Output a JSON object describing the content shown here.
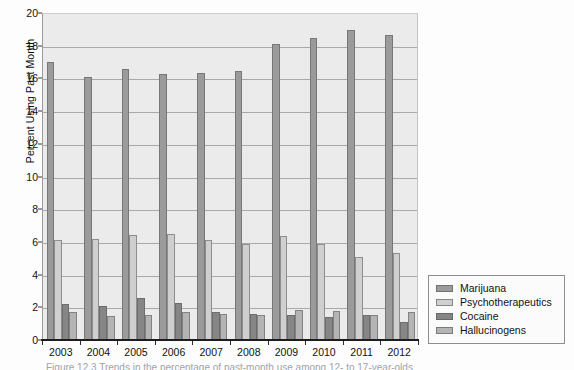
{
  "chart_data": {
    "type": "bar",
    "title": "",
    "subtitle": "",
    "xlabel": "",
    "ylabel": "Percent Using Past Month",
    "categories": [
      "2003",
      "2004",
      "2005",
      "2006",
      "2007",
      "2008",
      "2009",
      "2010",
      "2011",
      "2012"
    ],
    "ylim": [
      0,
      20
    ],
    "ytick_step": 2,
    "yticks": [
      "0",
      "2",
      "4",
      "6",
      "8",
      "10",
      "12",
      "14",
      "16",
      "18",
      "20"
    ],
    "grid": true,
    "grid_axis": "y",
    "legend_position": "right-outside-bottom",
    "series": [
      {
        "name": "Marijuana",
        "color": "#9b9b9b",
        "values": [
          17.0,
          16.1,
          16.6,
          16.25,
          16.35,
          16.45,
          18.1,
          18.45,
          18.95,
          18.65
        ]
      },
      {
        "name": "Psychotherapeutics",
        "color": "#cfcfcf",
        "values": [
          6.1,
          6.15,
          6.4,
          6.5,
          6.1,
          5.9,
          6.35,
          5.9,
          5.05,
          5.35
        ]
      },
      {
        "name": "Cocaine",
        "color": "#868686",
        "values": [
          2.2,
          2.1,
          2.6,
          2.25,
          1.7,
          1.6,
          1.55,
          1.4,
          1.55,
          1.1
        ]
      },
      {
        "name": "Hallucinogens",
        "color": "#b4b4b4",
        "values": [
          1.7,
          1.45,
          1.55,
          1.7,
          1.6,
          1.5,
          1.85,
          1.75,
          1.5,
          1.7
        ]
      }
    ]
  },
  "legend": {
    "items": [
      {
        "label": "Marijuana"
      },
      {
        "label": "Psychotherapeutics"
      },
      {
        "label": "Cocaine"
      },
      {
        "label": "Hallucinogens"
      }
    ]
  },
  "caption": {
    "text": "Figure 12.3  Trends in the percentage of past-month use among 12- to 17-year-olds"
  }
}
